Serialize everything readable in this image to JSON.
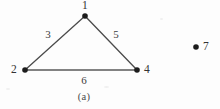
{
  "figure": {
    "caption": "(a)",
    "background_color": "#fdfdfd",
    "ink_color": "#3a3a3a"
  },
  "graph": {
    "vertices": [
      {
        "id": "v1",
        "label": "1",
        "x": 85,
        "y": 16,
        "label_x": 85,
        "label_y": 6,
        "radius": 2.8
      },
      {
        "id": "v2",
        "label": "2",
        "x": 25,
        "y": 70,
        "label_x": 14,
        "label_y": 70,
        "radius": 2.8
      },
      {
        "id": "v4",
        "label": "4",
        "x": 137,
        "y": 70,
        "label_x": 147,
        "label_y": 70,
        "radius": 2.8
      },
      {
        "id": "v7",
        "label": "7",
        "x": 196,
        "y": 47,
        "label_x": 206,
        "label_y": 47,
        "radius": 2.8
      }
    ],
    "edges": [
      {
        "id": "e3",
        "label": "3",
        "from": "v2",
        "to": "v1",
        "label_x": 48,
        "label_y": 34
      },
      {
        "id": "e5",
        "label": "5",
        "from": "v1",
        "to": "v4",
        "label_x": 116,
        "label_y": 34
      },
      {
        "id": "e6",
        "label": "6",
        "from": "v2",
        "to": "v4",
        "label_x": 84,
        "label_y": 80
      }
    ],
    "edge_color": "#4b4b4b",
    "edge_width": 1.3,
    "vertex_color": "#1c1c1c"
  }
}
